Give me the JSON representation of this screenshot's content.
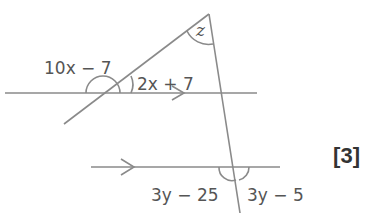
{
  "diagram": {
    "type": "parallel lines with transversals",
    "angles": {
      "apex": "z",
      "top_left": "10x − 7",
      "top_right": "2x + 7",
      "bottom_left": "3y − 25",
      "bottom_right": "3y − 5"
    },
    "marks": "[3]",
    "colors": {
      "line": "#8a8a8a",
      "text": "#555555",
      "marks": "#333333"
    }
  }
}
